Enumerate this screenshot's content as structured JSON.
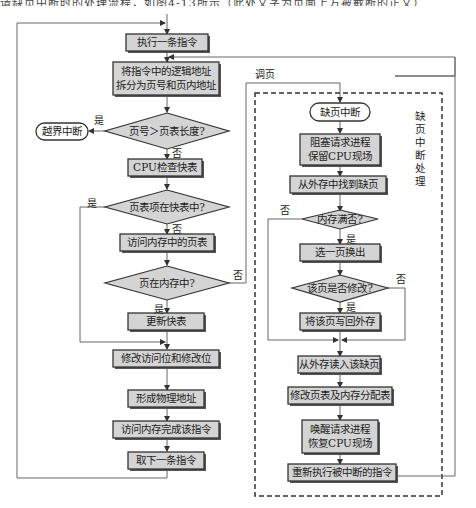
{
  "top_strip": {
    "text": "请缺页中断时的处理流程，如图4-13所示（此处文字为页面上方被截断的正文）"
  },
  "flowchart": {
    "main_flow": {
      "execute_instruction": "执行一条指令",
      "split_address_line1": "将指令中的逻辑地址",
      "split_address_line2": "拆分为页号和页内地址",
      "decision_bounds": "页号＞页表长度?",
      "out_of_bounds_interrupt": "越界中断",
      "cpu_check_tlb": "CPU检查快表",
      "decision_in_tlb": "页表项在快表中?",
      "access_page_table": "访问内存中的页表",
      "decision_page_in_memory": "页在内存中?",
      "update_tlb": "更新快表",
      "modify_bits": "修改访问位和修改位",
      "form_physical_address": "形成物理地址",
      "access_memory": "访问内存完成该指令",
      "fetch_next": "取下一条指令"
    },
    "page_fault_flow": {
      "region_label": "缺页中断处理",
      "page_fault_interrupt": "缺页中断",
      "block_process_line1": "阻塞请求进程",
      "block_process_line2": "保留CPU现场",
      "find_missing_page": "从外存中找到缺页",
      "decision_memory_full": "内存满否?",
      "select_page_out": "选一页换出",
      "decision_page_modified": "该页是否修改?",
      "write_back": "将该页写回外存",
      "read_in_page": "从外存读入该缺页",
      "modify_tables": "修改页表及内存分配表",
      "wake_process_line1": "唤醒请求进程",
      "wake_process_line2": "恢复CPU现场",
      "re_execute": "重新执行被中断的指令"
    },
    "edge_labels": {
      "yes": "是",
      "no": "否",
      "page_in": "调页"
    }
  }
}
